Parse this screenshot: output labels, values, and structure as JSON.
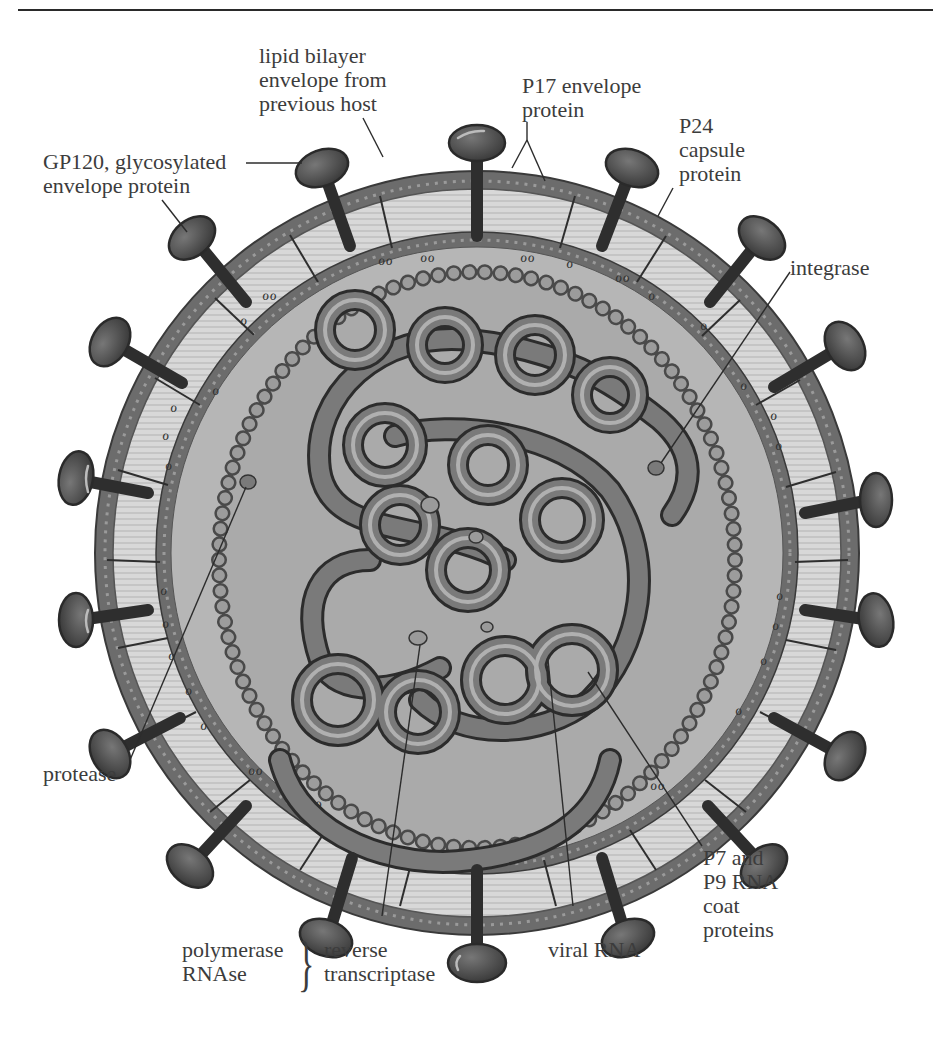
{
  "figure": {
    "labels": {
      "lipid_bilayer": [
        "lipid bilayer",
        "envelope from",
        "previous host"
      ],
      "gp120": [
        "GP120, glycosylated",
        "envelope protein"
      ],
      "p17": [
        "P17 envelope",
        "protein"
      ],
      "p24": [
        "P24",
        "capsule",
        "protein"
      ],
      "integrase": [
        "integrase"
      ],
      "protease": [
        "protease"
      ],
      "polymerase_group": [
        "polymerase",
        "RNAse"
      ],
      "reverse_transcriptase": [
        "reverse",
        "transcriptase"
      ],
      "viral_rna": [
        "viral RNA"
      ],
      "p7_p9": [
        "P7 and",
        "P9 RNA",
        "coat",
        "proteins"
      ]
    },
    "brace_symbol": "}"
  },
  "colors": {
    "background": "#ffffff",
    "text": "#3c3c3c",
    "outer_membrane": "#6e6e6e",
    "bilayer": "#d4d4d4",
    "matrix": "#b4b4b4",
    "capsid_interior": "#a6a6a6",
    "spike": "#4a4a4a",
    "rna": "#5a5a5a"
  }
}
